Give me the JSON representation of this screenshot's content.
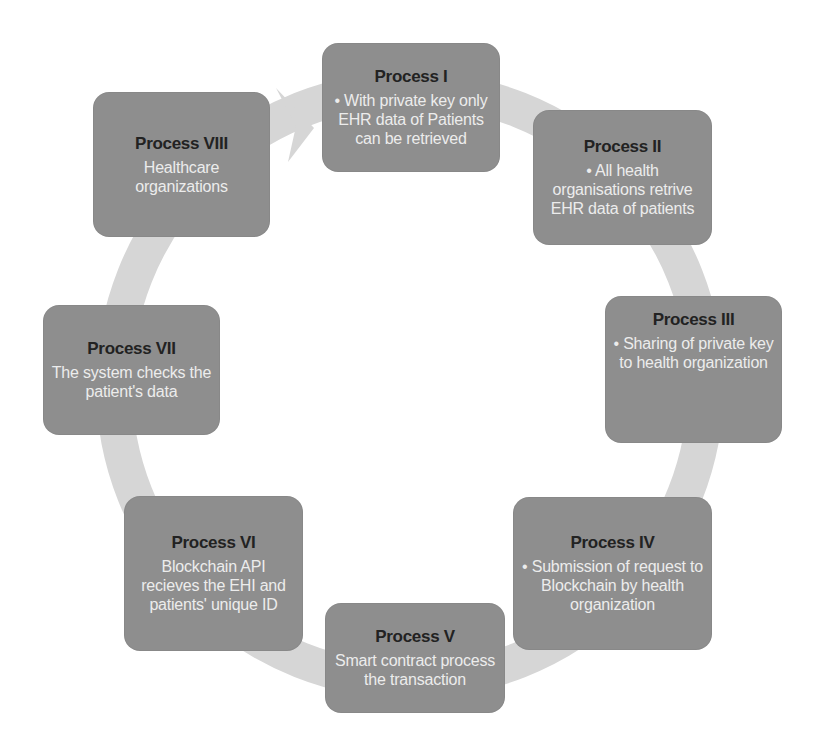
{
  "diagram": {
    "type": "cycle",
    "ring_color": "#d6d6d6",
    "box_color": "#8e8e8e",
    "title_color": "#222222",
    "text_color": "#ececec",
    "steps": [
      {
        "title": "Process I",
        "text": "• With private key only EHR data of Patients can be retrieved"
      },
      {
        "title": "Process II",
        "text": "• All health organisations retrive EHR data of patients"
      },
      {
        "title": "Process III",
        "text": "• Sharing of private key to health organization"
      },
      {
        "title": "Process IV",
        "text": "• Submission of request to Blockchain by health organization"
      },
      {
        "title": "Process V",
        "text": "Smart contract process the transaction"
      },
      {
        "title": "Process VI",
        "text": "Blockchain API recieves the EHI and patients' unique ID"
      },
      {
        "title": "Process VII",
        "text": "The system checks the patient's data"
      },
      {
        "title": "Process VIII",
        "text": "Healthcare organizations"
      }
    ],
    "arrow": {
      "from": "Process VIII",
      "to": "Process I",
      "icon": "arrowhead-right-icon"
    }
  }
}
